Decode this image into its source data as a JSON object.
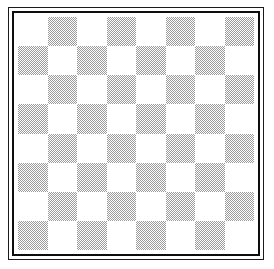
{
  "figure": {
    "background_color": "#ffffff"
  },
  "frame": {
    "outer_rule_color": "#1a1a1a",
    "inner_rule_color": "#0d0d0d",
    "gap_color": "#ffffff"
  },
  "board": {
    "rows": 8,
    "columns": 8,
    "total_squares": 64,
    "light_square_color": "#ffffff",
    "dark_square_color": "#9a9a9a",
    "dark_square_fill": "halftone-dither",
    "top_left_square": "light",
    "bottom_left_square": "dark",
    "squares": [
      [
        "light",
        "dark",
        "light",
        "dark",
        "light",
        "dark",
        "light",
        "dark"
      ],
      [
        "dark",
        "light",
        "dark",
        "light",
        "dark",
        "light",
        "dark",
        "light"
      ],
      [
        "light",
        "dark",
        "light",
        "dark",
        "light",
        "dark",
        "light",
        "dark"
      ],
      [
        "dark",
        "light",
        "dark",
        "light",
        "dark",
        "light",
        "dark",
        "light"
      ],
      [
        "light",
        "dark",
        "light",
        "dark",
        "light",
        "dark",
        "light",
        "dark"
      ],
      [
        "dark",
        "light",
        "dark",
        "light",
        "dark",
        "light",
        "dark",
        "light"
      ],
      [
        "light",
        "dark",
        "light",
        "dark",
        "light",
        "dark",
        "light",
        "dark"
      ],
      [
        "dark",
        "light",
        "dark",
        "light",
        "dark",
        "light",
        "dark",
        "light"
      ]
    ]
  }
}
